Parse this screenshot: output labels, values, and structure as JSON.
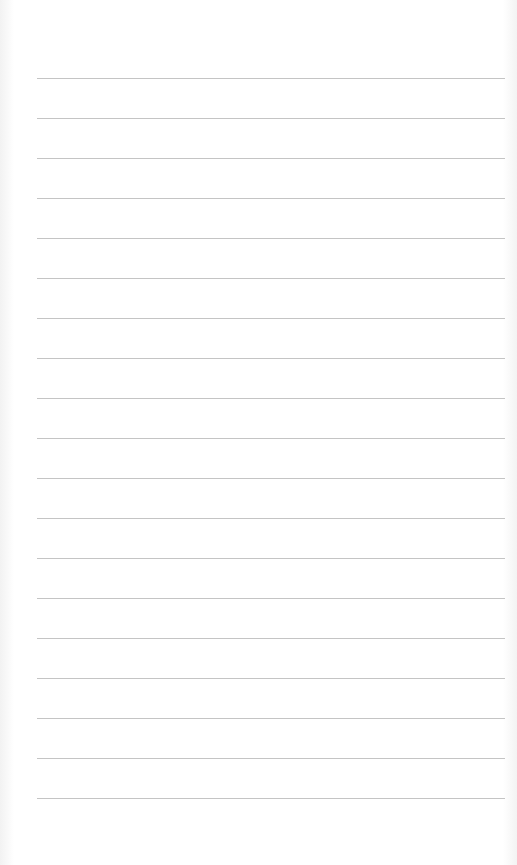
{
  "page": {
    "type": "lined-paper",
    "background_color": "#ffffff",
    "line_color": "#c4c4c4",
    "line_count": 19,
    "first_line_y": 78,
    "line_spacing": 40,
    "line_left": 37,
    "line_right": 505
  }
}
